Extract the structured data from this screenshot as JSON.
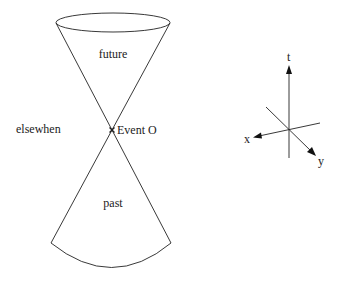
{
  "diagram": {
    "labels": {
      "future": "future",
      "past": "past",
      "elsewhen": "elsewhen",
      "event": "Event O"
    },
    "event_marker": "x",
    "axes": {
      "t": "t",
      "x": "x",
      "y": "y"
    },
    "colors": {
      "line": "#222222",
      "background": "#ffffff"
    }
  }
}
